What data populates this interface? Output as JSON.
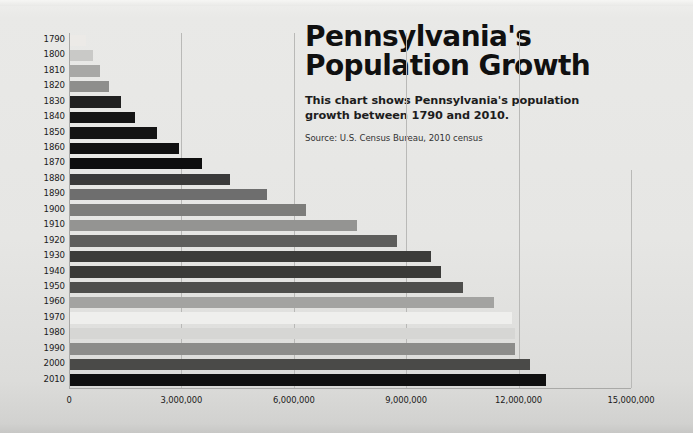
{
  "title": "Pennsylvania's\nPopulation Growth",
  "title_line1": "Pennsylvania's",
  "title_line2": "Population Growth",
  "subtitle": "This chart shows Pennsylvania's population growth between 1790 and 2010.",
  "source": "Source: U.S. Census Bureau, 2010 census",
  "chart_data": {
    "type": "bar",
    "orientation": "horizontal",
    "title": "Pennsylvania's Population Growth",
    "subtitle": "This chart shows Pennsylvania's population growth between 1790 and 2010.",
    "source": "Source: U.S. Census Bureau, 2010 census",
    "xlabel": "",
    "ylabel": "",
    "xlim": [
      0,
      15000000
    ],
    "xticks": [
      0,
      3000000,
      6000000,
      9000000,
      12000000,
      15000000
    ],
    "xtick_labels": [
      "0",
      "3,000,000",
      "6,000,000",
      "9,000,000",
      "12,000,000",
      "15,000,000"
    ],
    "grid": true,
    "legend": false,
    "categories": [
      "1790",
      "1800",
      "1810",
      "1820",
      "1830",
      "1840",
      "1850",
      "1860",
      "1870",
      "1880",
      "1890",
      "1900",
      "1910",
      "1920",
      "1930",
      "1940",
      "1950",
      "1960",
      "1970",
      "1980",
      "1990",
      "2000",
      "2010"
    ],
    "values": [
      434373,
      602365,
      810091,
      1049458,
      1348233,
      1724033,
      2311786,
      2906215,
      3521951,
      4282891,
      5258113,
      6302115,
      7665111,
      8720017,
      9631350,
      9900180,
      10498012,
      11319366,
      11800766,
      11864720,
      11881643,
      12281054,
      12702379
    ],
    "bar_colors": [
      "#eceae7",
      "#c9c9c7",
      "#a8a8a6",
      "#8e8e8c",
      "#202020",
      "#151515",
      "#141414",
      "#101010",
      "#0e0e0e",
      "#3a3a3a",
      "#6e6e6e",
      "#7d7d7b",
      "#949492",
      "#5e5e5c",
      "#3c3c3a",
      "#3a3a38",
      "#4e4e4c",
      "#a3a3a1",
      "#efefed",
      "#d6d6d4",
      "#8c8c8a",
      "#4a4a48",
      "#101010"
    ]
  }
}
